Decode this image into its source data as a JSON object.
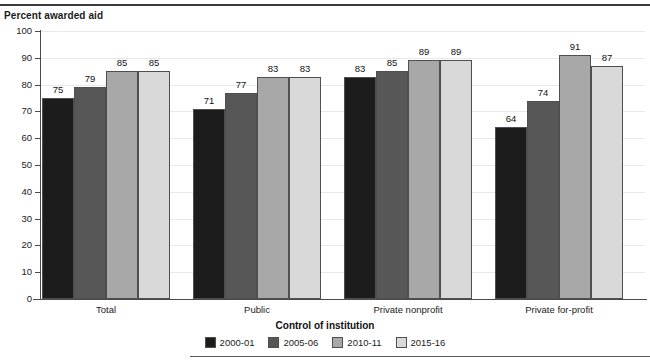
{
  "figure": {
    "y_axis_title": "Percent awarded aid",
    "x_axis_title": "Control of institution"
  },
  "chart_data": {
    "type": "bar",
    "title": "",
    "subtitle": "",
    "xlabel": "Control of institution",
    "ylabel": "Percent awarded aid",
    "ylim": [
      0,
      100
    ],
    "ytick_step": 10,
    "yticks": [
      "100",
      "90",
      "80",
      "70",
      "60",
      "50",
      "40",
      "30",
      "20",
      "10",
      "0"
    ],
    "grid": true,
    "legend_position": "bottom-center",
    "categories": [
      "Total",
      "Public",
      "Private nonprofit",
      "Private for-profit"
    ],
    "series": [
      {
        "name": "2000-01",
        "color": "#1c1c1c",
        "values": [
          75,
          71,
          83,
          64
        ]
      },
      {
        "name": "2005-06",
        "color": "#575757",
        "values": [
          79,
          77,
          85,
          74
        ]
      },
      {
        "name": "2010-11",
        "color": "#a8a8a8",
        "values": [
          85,
          83,
          89,
          91
        ]
      },
      {
        "name": "2015-16",
        "color": "#d9d9d9",
        "values": [
          85,
          83,
          89,
          87
        ]
      }
    ]
  },
  "legend": {
    "items": [
      {
        "label": "2000-01"
      },
      {
        "label": "2005-06"
      },
      {
        "label": "2010-11"
      },
      {
        "label": "2015-16"
      }
    ]
  }
}
